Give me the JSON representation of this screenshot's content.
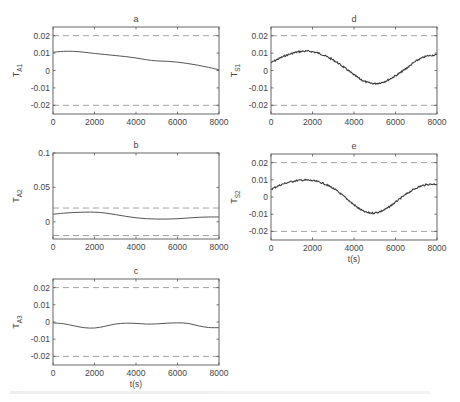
{
  "figure": {
    "caption_visible": false
  },
  "chart_data": [
    {
      "id": "a",
      "type": "line",
      "title": "a",
      "xlabel": "",
      "ylabel": "T",
      "ylabel_sub": "A1",
      "xlim": [
        0,
        8000
      ],
      "ylim": [
        -0.025,
        0.025
      ],
      "xticks": [
        0,
        2000,
        4000,
        6000,
        8000
      ],
      "yticks": [
        -0.02,
        -0.01,
        0,
        0.01,
        0.02
      ],
      "ytick_labels": [
        "-0.02",
        "-0.01",
        "0",
        "0.01",
        "0.02"
      ],
      "thresholds": [
        0.02,
        -0.02
      ],
      "noisy": false,
      "box": [
        53,
        27,
        219,
        114
      ],
      "x": [
        0,
        500,
        1000,
        1500,
        2000,
        2500,
        3000,
        3500,
        4000,
        4500,
        5000,
        5500,
        6000,
        6500,
        7000,
        7500,
        8000
      ],
      "y": [
        0.0105,
        0.011,
        0.011,
        0.0105,
        0.0098,
        0.0092,
        0.0086,
        0.008,
        0.0072,
        0.0062,
        0.0055,
        0.0053,
        0.0048,
        0.004,
        0.003,
        0.0018,
        0.0004
      ]
    },
    {
      "id": "b",
      "type": "line",
      "title": "b",
      "xlabel": "",
      "ylabel": "T",
      "ylabel_sub": "A2",
      "xlim": [
        0,
        8000
      ],
      "ylim": [
        -0.025,
        0.1
      ],
      "xticks": [
        0,
        2000,
        4000,
        6000,
        8000
      ],
      "yticks": [
        0,
        0.05,
        0.1
      ],
      "ytick_labels": [
        "0",
        "0.05",
        "0.1"
      ],
      "thresholds": [
        0.02,
        -0.02
      ],
      "noisy": false,
      "box": [
        53,
        153,
        219,
        239
      ],
      "x": [
        0,
        500,
        1000,
        1500,
        2000,
        2500,
        3000,
        3500,
        4000,
        4500,
        5000,
        5500,
        6000,
        6500,
        7000,
        7500,
        8000
      ],
      "y": [
        0.011,
        0.0125,
        0.0135,
        0.014,
        0.014,
        0.0128,
        0.0105,
        0.008,
        0.0058,
        0.0045,
        0.004,
        0.004,
        0.0045,
        0.0055,
        0.0065,
        0.007,
        0.007
      ]
    },
    {
      "id": "c",
      "type": "line",
      "title": "c",
      "xlabel": "t(s)",
      "ylabel": "T",
      "ylabel_sub": "A3",
      "xlim": [
        0,
        8000
      ],
      "ylim": [
        -0.025,
        0.025
      ],
      "xticks": [
        0,
        2000,
        4000,
        6000,
        8000
      ],
      "yticks": [
        -0.02,
        -0.01,
        0,
        0.01,
        0.02
      ],
      "ytick_labels": [
        "-0.02",
        "-0.01",
        "0",
        "0.01",
        "0.02"
      ],
      "thresholds": [
        0.02,
        -0.02
      ],
      "noisy": false,
      "box": [
        53,
        279,
        219,
        365
      ],
      "x": [
        0,
        500,
        1000,
        1500,
        2000,
        2500,
        3000,
        3500,
        4000,
        4500,
        5000,
        5500,
        6000,
        6500,
        7000,
        7500,
        8000
      ],
      "y": [
        -0.0005,
        -0.001,
        -0.0022,
        -0.0033,
        -0.0035,
        -0.0025,
        -0.0012,
        -0.0007,
        -0.0008,
        -0.0012,
        -0.0011,
        -0.0007,
        -0.0005,
        -0.0008,
        -0.0022,
        -0.0032,
        -0.0033
      ]
    },
    {
      "id": "d",
      "type": "line",
      "title": "d",
      "xlabel": "",
      "ylabel": "T",
      "ylabel_sub": "S1",
      "xlim": [
        0,
        8000
      ],
      "ylim": [
        -0.025,
        0.025
      ],
      "xticks": [
        0,
        2000,
        4000,
        6000,
        8000
      ],
      "yticks": [
        -0.02,
        -0.01,
        0,
        0.01,
        0.02
      ],
      "ytick_labels": [
        "-0.02",
        "-0.01",
        "0",
        "0.01",
        "0.02"
      ],
      "thresholds": [
        0.02,
        -0.02
      ],
      "noisy": true,
      "box": [
        271,
        27,
        437,
        114
      ],
      "x": [
        0,
        500,
        1000,
        1500,
        2000,
        2500,
        3000,
        3500,
        4000,
        4500,
        5000,
        5500,
        6000,
        6500,
        7000,
        7500,
        8000
      ],
      "y": [
        0.0045,
        0.0075,
        0.0098,
        0.011,
        0.0108,
        0.009,
        0.006,
        0.002,
        -0.0025,
        -0.0062,
        -0.0075,
        -0.0062,
        -0.003,
        0.001,
        0.0055,
        0.0082,
        0.009
      ]
    },
    {
      "id": "e",
      "type": "line",
      "title": "e",
      "xlabel": "t(s)",
      "ylabel": "T",
      "ylabel_sub": "S2",
      "xlim": [
        0,
        8000
      ],
      "ylim": [
        -0.025,
        0.025
      ],
      "xticks": [
        0,
        2000,
        4000,
        6000,
        8000
      ],
      "yticks": [
        -0.02,
        -0.01,
        0,
        0.01,
        0.02
      ],
      "ytick_labels": [
        "-0.02",
        "-0.01",
        "0",
        "0.01",
        "0.02"
      ],
      "thresholds": [
        0.02,
        -0.02
      ],
      "noisy": true,
      "box": [
        271,
        154,
        437,
        240
      ],
      "x": [
        0,
        500,
        1000,
        1500,
        2000,
        2500,
        3000,
        3500,
        4000,
        4500,
        5000,
        5500,
        6000,
        6500,
        7000,
        7500,
        8000
      ],
      "y": [
        0.0045,
        0.0072,
        0.009,
        0.0098,
        0.0095,
        0.008,
        0.005,
        0.0005,
        -0.0045,
        -0.0085,
        -0.0092,
        -0.0072,
        -0.003,
        0.0015,
        0.0052,
        0.0072,
        0.0075
      ]
    }
  ]
}
